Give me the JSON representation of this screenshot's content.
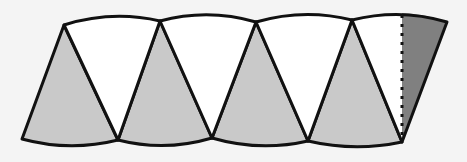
{
  "diagram": {
    "colors": {
      "background": "#f4f4f4",
      "shaded": "#c9c9c9",
      "white": "#ffffff",
      "dark": "#808080",
      "stroke": "#111111"
    },
    "shaded_sectors": 4,
    "white_sectors": 4,
    "partial_dark_sector": 1,
    "dashed_line": "fold line at right end"
  }
}
